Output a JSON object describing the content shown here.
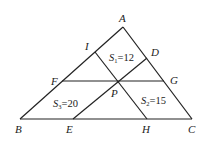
{
  "diagram": {
    "type": "geometry",
    "points": {
      "A": {
        "label": "A",
        "x": 123,
        "y": 27
      },
      "B": {
        "label": "B",
        "x": 20,
        "y": 119
      },
      "C": {
        "label": "C",
        "x": 192,
        "y": 119
      },
      "I": {
        "label": "I",
        "x": 95,
        "y": 52
      },
      "D": {
        "label": "D",
        "x": 147,
        "y": 58
      },
      "F": {
        "label": "F",
        "x": 62,
        "y": 81
      },
      "G": {
        "label": "G",
        "x": 164,
        "y": 81
      },
      "P": {
        "label": "P",
        "x": 117,
        "y": 81
      },
      "E": {
        "label": "E",
        "x": 73,
        "y": 119
      },
      "H": {
        "label": "H",
        "x": 147,
        "y": 119
      }
    },
    "areas": {
      "s1": {
        "name": "S",
        "sub": "1",
        "value": "=12"
      },
      "s2": {
        "name": "S",
        "sub": "2",
        "value": "=15"
      },
      "s3": {
        "name": "S",
        "sub": "3",
        "value": "=20"
      }
    }
  }
}
